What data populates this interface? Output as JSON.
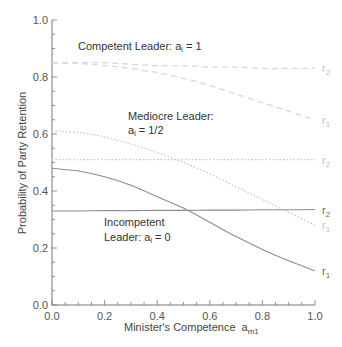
{
  "chart_data": {
    "type": "line",
    "title": "",
    "xlabel": "Minister's Competence  a_m1",
    "ylabel": "Probability of Party Retention",
    "xlim": [
      0.0,
      1.0
    ],
    "ylim": [
      0.0,
      1.0
    ],
    "xticks": [
      "0.0",
      "0.2",
      "0.4",
      "0.6",
      "0.8",
      "1.0"
    ],
    "yticks": [
      "0.0",
      "0.2",
      "0.4",
      "0.6",
      "0.8",
      "1.0"
    ],
    "grid": false,
    "x": [
      0.0,
      0.1,
      0.2,
      0.3,
      0.4,
      0.5,
      0.6,
      0.7,
      0.8,
      0.9,
      1.0
    ],
    "series": [
      {
        "name": "Competent Leader r2",
        "group": "Competent Leader: a_l = 1",
        "end_label": "r2",
        "style": "dashed",
        "color": "#d9d9d9",
        "values": [
          0.85,
          0.85,
          0.85,
          0.845,
          0.84,
          0.84,
          0.835,
          0.835,
          0.83,
          0.83,
          0.83
        ]
      },
      {
        "name": "Competent Leader r1",
        "group": "Competent Leader: a_l = 1",
        "end_label": "r1",
        "style": "dashed",
        "color": "#d9d9d9",
        "values": [
          0.85,
          0.848,
          0.84,
          0.83,
          0.815,
          0.795,
          0.77,
          0.74,
          0.71,
          0.68,
          0.65
        ]
      },
      {
        "name": "Mediocre Leader r2",
        "group": "Mediocre Leader: a_l = 1/2",
        "end_label": "r2",
        "style": "dotted",
        "color": "#c8c8c8",
        "values": [
          0.51,
          0.51,
          0.51,
          0.51,
          0.51,
          0.51,
          0.51,
          0.51,
          0.51,
          0.51,
          0.51
        ]
      },
      {
        "name": "Mediocre Leader r1",
        "group": "Mediocre Leader: a_l = 1/2",
        "end_label": "r1",
        "style": "dotted",
        "color": "#c8c8c8",
        "values": [
          0.61,
          0.605,
          0.59,
          0.565,
          0.535,
          0.5,
          0.46,
          0.415,
          0.37,
          0.325,
          0.28
        ]
      },
      {
        "name": "Incompetent Leader r2",
        "group": "Incompetent Leader: a_l = 0",
        "end_label": "r2",
        "style": "solid",
        "color": "#8c8c8c",
        "values": [
          0.33,
          0.33,
          0.331,
          0.331,
          0.332,
          0.332,
          0.333,
          0.333,
          0.334,
          0.334,
          0.335
        ]
      },
      {
        "name": "Incompetent Leader r1",
        "group": "Incompetent Leader: a_l = 0",
        "end_label": "r1",
        "style": "solid",
        "color": "#8c8c8c",
        "values": [
          0.48,
          0.47,
          0.45,
          0.42,
          0.38,
          0.34,
          0.29,
          0.24,
          0.195,
          0.155,
          0.12
        ]
      }
    ],
    "annotations": [
      {
        "text": "Competent Leader: a_l = 1",
        "x": 0.04,
        "y": 0.88
      },
      {
        "text": "Mediocre Leader:",
        "x": 0.26,
        "y": 0.67
      },
      {
        "text": "a_l = 1/2",
        "x": 0.26,
        "y": 0.63
      },
      {
        "text": "Incompetent",
        "x": 0.2,
        "y": 0.29
      },
      {
        "text": "Leader: a_l = 0",
        "x": 0.2,
        "y": 0.25
      }
    ],
    "legend": "none (inline end labels r1/r2)"
  },
  "labels": {
    "yaxis_title": "Probability of Party Retention",
    "xaxis_title_main": "Minister's Competence",
    "xaxis_title_var": "a",
    "xaxis_title_sub": "m1",
    "competent_line1": "Competent Leader: a",
    "competent_sub": "l",
    "competent_rest": " = 1",
    "mediocre_line1": "Mediocre Leader:",
    "mediocre_line2_a": "a",
    "mediocre_line2_sub": "l",
    "mediocre_line2_rest": " = 1/2",
    "incompetent_line1": "Incompetent",
    "incompetent_line2_a": "Leader: a",
    "incompetent_line2_sub": "l",
    "incompetent_line2_rest": " = 0",
    "r": "r",
    "sub1": "1",
    "sub2": "2"
  }
}
